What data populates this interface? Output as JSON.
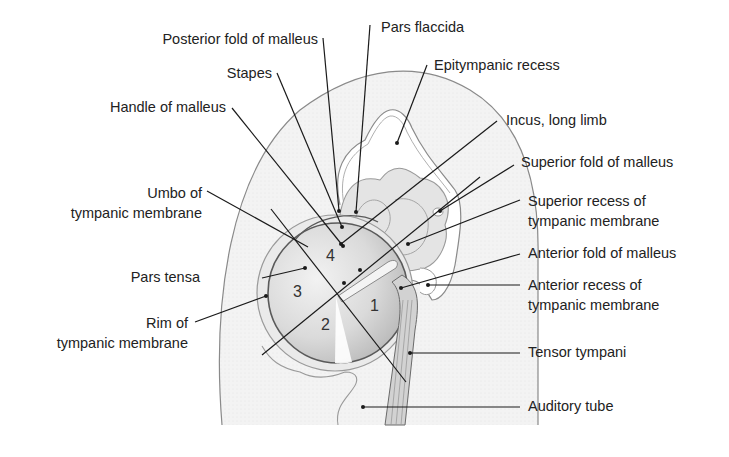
{
  "diagram": {
    "colors": {
      "background": "#ffffff",
      "outline": "#8a8a8a",
      "fill_light": "#efefef",
      "membrane": "#d6d6d6",
      "leader": "#1a1a1a",
      "text": "#222222"
    },
    "labels_left": {
      "posterior_fold": "Posterior fold of malleus",
      "stapes": "Stapes",
      "handle_malleus": "Handle of malleus",
      "umbo_1": "Umbo of",
      "umbo_2": "tympanic membrane",
      "pars_tensa": "Pars tensa",
      "rim_1": "Rim of",
      "rim_2": "tympanic membrane"
    },
    "labels_right": {
      "pars_flaccida": "Pars flaccida",
      "epitympanic": "Epitympanic recess",
      "incus": "Incus, long limb",
      "superior_fold": "Superior fold of malleus",
      "superior_recess_1": "Superior recess of",
      "superior_recess_2": "tympanic membrane",
      "anterior_fold": "Anterior fold of malleus",
      "anterior_recess_1": "Anterior recess of",
      "anterior_recess_2": "tympanic membrane",
      "tensor": "Tensor tympani",
      "auditory_tube": "Auditory tube"
    },
    "quadrants": {
      "q1": "1",
      "q2": "2",
      "q3": "3",
      "q4": "4"
    }
  }
}
